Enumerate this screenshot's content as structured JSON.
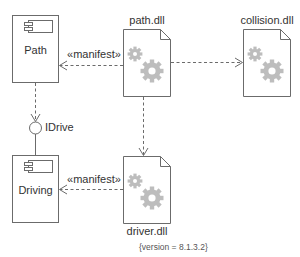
{
  "diagram": {
    "type": "UML deployment/component diagram",
    "colors": {
      "stroke": "#6b6b6b",
      "gear": "#bdbdbd",
      "text": "#333333",
      "background": "#ffffff"
    },
    "components": [
      {
        "id": "path",
        "label": "Path",
        "icon": "component-icon"
      },
      {
        "id": "driving",
        "label": "Driving",
        "icon": "component-icon"
      }
    ],
    "interfaces": [
      {
        "id": "idrive",
        "label": "IDrive"
      }
    ],
    "artifacts": [
      {
        "id": "path_dll",
        "label": "path.dll",
        "icon": "gear-icon"
      },
      {
        "id": "collision_dll",
        "label": "collision.dll",
        "icon": "gear-icon"
      },
      {
        "id": "driver_dll",
        "label": "driver.dll",
        "icon": "gear-icon",
        "tagged_value": "{version = 8.1.3.2}"
      }
    ],
    "relations": [
      {
        "from": "path_dll",
        "to": "path",
        "style": "dashed-open-arrow",
        "label": "«manifest»"
      },
      {
        "from": "driver_dll",
        "to": "driving",
        "style": "dashed-open-arrow",
        "label": "«manifest»"
      },
      {
        "from": "path_dll",
        "to": "collision_dll",
        "style": "dashed-open-arrow",
        "label": ""
      },
      {
        "from": "path_dll",
        "to": "driver_dll",
        "style": "dashed-open-arrow",
        "label": ""
      },
      {
        "from": "path",
        "to": "idrive",
        "style": "dashed-open-arrow",
        "label": ""
      },
      {
        "from": "driving",
        "to": "idrive",
        "style": "solid-line",
        "label": ""
      }
    ]
  },
  "labels": {
    "path": "Path",
    "driving": "Driving",
    "idrive": "IDrive",
    "path_dll": "path.dll",
    "collision_dll": "collision.dll",
    "driver_dll": "driver.dll",
    "driver_version": "{version = 8.1.3.2}",
    "manifest_top": "«manifest»",
    "manifest_bottom": "«manifest»"
  }
}
